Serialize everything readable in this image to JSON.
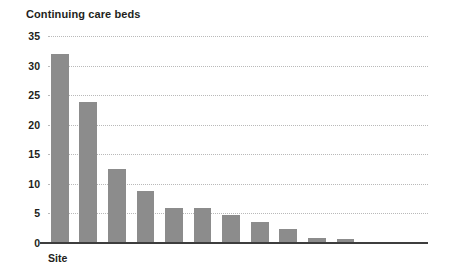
{
  "chart_data": {
    "type": "bar",
    "title": "Continuing care beds",
    "xlabel": "Site",
    "ylabel": "",
    "ylim": [
      0,
      35
    ],
    "yticks": [
      0,
      5,
      10,
      15,
      20,
      25,
      30,
      35
    ],
    "ytick_labels": [
      "0",
      "5",
      "10",
      "15",
      "20",
      "25",
      "30",
      "35"
    ],
    "grid": true,
    "grid_style": "dotted",
    "legend": "none",
    "categories": [
      "Site 1",
      "Site 2",
      "Site 3",
      "Site 4",
      "Site 5",
      "Site 6",
      "Site 7",
      "Site 8",
      "Site 9",
      "Site 10",
      "Site 11",
      "Site 12"
    ],
    "category_tick_labels_shown": false,
    "values": [
      32,
      23.8,
      12.5,
      8.8,
      6,
      6,
      4.8,
      3.6,
      2.4,
      0.9,
      0.6,
      0.1
    ],
    "series": [
      {
        "name": "Continuing care beds",
        "values": [
          32,
          23.8,
          12.5,
          8.8,
          6,
          6,
          4.8,
          3.6,
          2.4,
          0.9,
          0.6,
          0.1
        ]
      }
    ],
    "bar_color": "#8c8c8c",
    "axis_color": "#3d3d3d",
    "gridline_color": "#b9b9b9",
    "text_color": "#231f20"
  }
}
